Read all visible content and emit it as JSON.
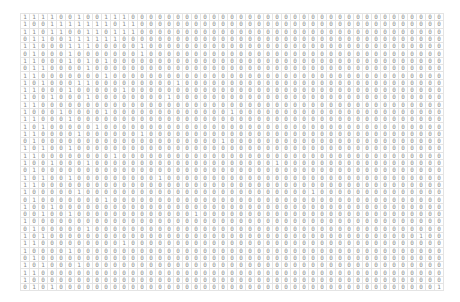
{
  "matrix": {
    "rows": 38,
    "cols": 47,
    "cells": [
      "11110010011100000000000000000000000000000000000",
      "10011111110110000000000000000000000000000000000",
      "11011001101110000000000000000000000000000000000",
      "01100111111000000000000000000000000000000000000",
      "11000111000001000000000000000000000000000000000",
      "01000100000001000000000000000000000000000000000",
      "11000101010000000000000000000000000000000000000",
      "01100001000000000000000000000000000000000000000",
      "11000000010000000000000000000000000000000000000",
      "10100011000000000100000000000000000000000000000",
      "11000100000100000000000000000000000000000000000",
      "10010001000000001000000000000000000000000000000",
      "11000000000000000000000000000000000000000000000",
      "10001000010000000000000100000000000000000000000",
      "11000100000000000000000000000000000000000000000",
      "10100000100000000000000000000000000000000000000",
      "11000010000001000000000000000000000000000000000",
      "01000000000000000000001000000000000000000000000",
      "10100100000000000000000000000000000000000000000",
      "11000000001000000000000000000000000000000000000",
      "10010001000000000000000000001000000000000000000",
      "01000000000000000000000000000000000000000000000",
      "10100100000000010000000000000000000000000000000",
      "11000000000000000000000000000000000000000000000",
      "10000010000000000000000000000000100000000000000",
      "01000000010000000000000000000000000000000000000",
      "10010000000000000000000000000000000000000000000",
      "00100100000000000001000000000000000000000000000",
      "10000000000000000000000000000000000000000000000",
      "01000001000000000000000000000000000000000000000",
      "10100000000000000000000000000000000000000000100",
      "11000000000100000000000000000000000000000000000",
      "10000100000000000000000000000000000000000000000",
      "01000000000000000000000000000000000000000000000",
      "10100010000000000000000000000000000000000000000",
      "11000000000000000000000000000000000000000000000",
      "10000000000000000000000000000000000000000000000",
      "01010000000000000000000000000000000000000000001"
    ]
  }
}
